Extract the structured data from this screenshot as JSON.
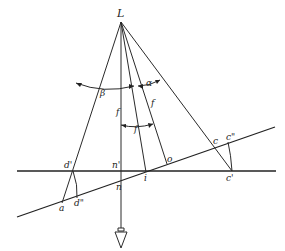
{
  "diagram": {
    "labels": {
      "L": "L",
      "beta": "β",
      "alpha": "α",
      "f_vertical": "f",
      "f_axis": "f",
      "f_arc": "f",
      "d_prime": "d'",
      "n_prime": "n'",
      "o": "o",
      "c": "c",
      "c_double_prime": "c\"",
      "a": "a",
      "d_double_prime": "d\"",
      "n": "n",
      "i": "i",
      "c_prime": "c'"
    },
    "points": {
      "L": [
        121,
        22
      ],
      "a": [
        62,
        203
      ],
      "d_prime": [
        73,
        171
      ],
      "d_double_prime": [
        77,
        198
      ],
      "n_prime": [
        121,
        171
      ],
      "n": [
        121,
        182
      ],
      "i": [
        146,
        172
      ],
      "o": [
        167,
        164
      ],
      "c": [
        215,
        146
      ],
      "c_double_prime": [
        228,
        142
      ],
      "c_prime": [
        232,
        171
      ]
    },
    "lines": {
      "horizontal": [
        [
          17,
          171
        ],
        [
          276,
          171
        ]
      ],
      "tilted": [
        [
          17,
          217
        ],
        [
          275,
          127
        ]
      ]
    }
  }
}
